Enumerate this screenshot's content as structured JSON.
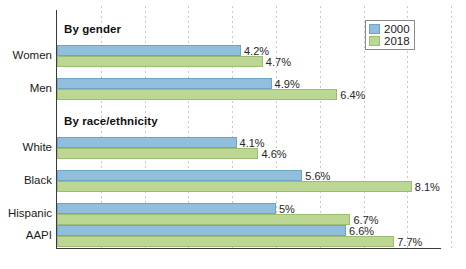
{
  "chart_data": {
    "type": "bar",
    "orientation": "horizontal",
    "title": "",
    "xlabel": "",
    "ylabel": "",
    "grid": true,
    "legend_position": "top-right",
    "xlim": [
      0,
      9
    ],
    "value_suffix": "%",
    "gridline_values": [
      1,
      2,
      3,
      4,
      5,
      6,
      7,
      8,
      9
    ],
    "series": [
      {
        "name": "2000",
        "color": "#92bedd",
        "border": "#6fa4c9"
      },
      {
        "name": "2018",
        "color": "#bcd694",
        "border": "#9dbd70"
      }
    ],
    "sections": [
      {
        "heading": "By gender",
        "rows": [
          {
            "category": "Women",
            "values": [
              4.2,
              4.7
            ],
            "labels": [
              "4.2%",
              "4.7%"
            ]
          },
          {
            "category": "Men",
            "values": [
              4.9,
              6.4
            ],
            "labels": [
              "4.9%",
              "6.4%"
            ]
          }
        ]
      },
      {
        "heading": "By race/ethnicity",
        "rows": [
          {
            "category": "White",
            "values": [
              4.1,
              4.6
            ],
            "labels": [
              "4.1%",
              "4.6%"
            ]
          },
          {
            "category": "Black",
            "values": [
              5.6,
              8.1
            ],
            "labels": [
              "5.6%",
              "8.1%"
            ]
          },
          {
            "category": "Hispanic",
            "values": [
              5.0,
              6.7
            ],
            "labels": [
              "5%",
              "6.7%"
            ]
          },
          {
            "category": "AAPI",
            "values": [
              6.6,
              7.7
            ],
            "labels": [
              "6.6%",
              "7.7%"
            ]
          }
        ]
      }
    ]
  },
  "legend": {
    "items": [
      {
        "label": "2000"
      },
      {
        "label": "2018"
      }
    ]
  },
  "headings": {
    "gender": "By gender",
    "race": "By race/ethnicity"
  }
}
